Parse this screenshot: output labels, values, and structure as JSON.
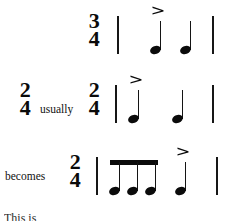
{
  "figure": {
    "kind": "music-notation-example",
    "background_color": "#ffffff",
    "ink_color": "#0b0b0b"
  },
  "rows": [
    {
      "id": "row-1",
      "lead_label": "",
      "lead_timesig": null,
      "timesig": {
        "numerator": "3",
        "denominator": "4"
      },
      "notes": [
        {
          "type": "quarter",
          "accent": ">"
        },
        {
          "type": "quarter",
          "accent": ""
        }
      ],
      "barlines": 2
    },
    {
      "id": "row-2",
      "lead_label": "usually",
      "lead_timesig": {
        "numerator": "2",
        "denominator": "4"
      },
      "timesig": {
        "numerator": "2",
        "denominator": "4"
      },
      "notes": [
        {
          "type": "quarter",
          "accent": ">"
        },
        {
          "type": "quarter",
          "accent": ""
        }
      ],
      "barlines": 2
    },
    {
      "id": "row-3",
      "lead_label": "becomes",
      "lead_timesig": null,
      "timesig": {
        "numerator": "2",
        "denominator": "4"
      },
      "notes": [
        {
          "type": "eighth",
          "accent": "",
          "beamed": true
        },
        {
          "type": "eighth",
          "accent": "",
          "beamed": true
        },
        {
          "type": "eighth",
          "accent": "",
          "beamed": true
        },
        {
          "type": "quarter",
          "accent": ">"
        }
      ],
      "barlines": 2
    }
  ],
  "caption": {
    "cutoff_line": "This is"
  }
}
